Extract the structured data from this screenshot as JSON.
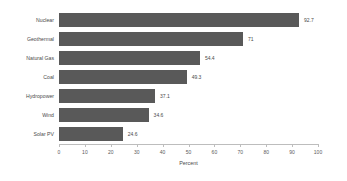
{
  "chart_data": {
    "type": "bar",
    "orientation": "horizontal",
    "title": "",
    "xlabel": "Percent",
    "ylabel": "",
    "xlim": [
      0,
      100
    ],
    "xticks": [
      0,
      10,
      20,
      30,
      40,
      50,
      60,
      70,
      80,
      90,
      100
    ],
    "xtick_labels": [
      "0",
      "10",
      "20",
      "30",
      "40",
      "50",
      "60",
      "70",
      "80",
      "90",
      "100"
    ],
    "grid": false,
    "legend": false,
    "bar_color": "#595959",
    "background_color": "#ffffff",
    "text_color": "#4a4a4a",
    "categories": [
      "Nuclear",
      "Geothermal",
      "Natural Gas",
      "Coal",
      "Hydropower",
      "Wind",
      "Solar PV"
    ],
    "values": [
      92.7,
      71,
      54.4,
      49.3,
      37.1,
      34.6,
      24.6
    ],
    "value_labels": [
      "92.7",
      "71",
      "54.4",
      "49.3",
      "37.1",
      "34.6",
      "24.6"
    ]
  }
}
